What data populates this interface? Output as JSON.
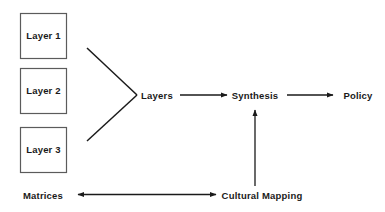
{
  "diagram": {
    "background_color": "#ffffff",
    "stroke_color": "#1a1a1a",
    "box_border_color": "#5b5b5b",
    "text_color": "#1a1a1a",
    "boxes": [
      {
        "id": "layer-1",
        "label": "Layer 1",
        "x": 20,
        "y": 13,
        "w": 46,
        "h": 45
      },
      {
        "id": "layer-2",
        "label": "Layer 2",
        "x": 20,
        "y": 68,
        "w": 46,
        "h": 45
      },
      {
        "id": "layer-3",
        "label": "Layer 3",
        "x": 20,
        "y": 127,
        "w": 46,
        "h": 45
      }
    ],
    "nodes": [
      {
        "id": "layers",
        "label": "Layers",
        "x": 157,
        "y": 95
      },
      {
        "id": "synthesis",
        "label": "Synthesis",
        "x": 255,
        "y": 95
      },
      {
        "id": "policy",
        "label": "Policy",
        "x": 358,
        "y": 95
      },
      {
        "id": "matrices",
        "label": "Matrices",
        "x": 43,
        "y": 195
      },
      {
        "id": "cultural-mapping",
        "label": "Cultural Mapping",
        "x": 262,
        "y": 195
      }
    ],
    "connectors": [
      {
        "id": "vee-upper",
        "from": "layer-1",
        "to": "layers",
        "kind": "line",
        "arrow": "none"
      },
      {
        "id": "vee-lower",
        "from": "layer-3",
        "to": "layers",
        "kind": "line",
        "arrow": "none"
      },
      {
        "id": "layers-to-synthesis",
        "from": "layers",
        "to": "synthesis",
        "kind": "arrow",
        "arrow": "end"
      },
      {
        "id": "synthesis-to-policy",
        "from": "synthesis",
        "to": "policy",
        "kind": "arrow",
        "arrow": "end"
      },
      {
        "id": "cultural-mapping-to-synthesis",
        "from": "cultural-mapping",
        "to": "synthesis",
        "kind": "arrow",
        "arrow": "end"
      },
      {
        "id": "matrices-cultural-mapping",
        "from": "cultural-mapping",
        "to": "matrices",
        "kind": "arrow",
        "arrow": "both"
      }
    ]
  }
}
